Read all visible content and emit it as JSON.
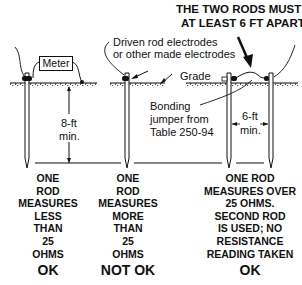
{
  "header": {
    "line1": "THE TWO RODS MUST BE",
    "line2": "AT LEAST 6 FT APART"
  },
  "labels": {
    "meter": "Meter",
    "driven_line1": "Driven rod electrodes",
    "driven_line2": "or other made electrodes",
    "grade": "Grade",
    "bonding_line1": "Bonding",
    "bonding_line2": "jumper from",
    "bonding_line3": "Table 250-94",
    "depth_line1": "8-ft",
    "depth_line2": "min.",
    "spacing_line1": "6-ft",
    "spacing_line2": "min."
  },
  "columns": [
    {
      "lines": [
        "ONE",
        "ROD",
        "MEASURES",
        "LESS",
        "THAN",
        "25",
        "OHMS"
      ],
      "verdict": "OK"
    },
    {
      "lines": [
        "ONE",
        "ROD",
        "MEASURES",
        "MORE",
        "THAN",
        "25",
        "OHMS"
      ],
      "verdict": "NOT OK"
    },
    {
      "lines": [
        "ONE ROD",
        "MEASURES OVER",
        "25 OHMS.",
        "SECOND ROD",
        "IS USED; NO",
        "RESISTANCE",
        "READING TAKEN"
      ],
      "verdict": "OK"
    }
  ]
}
